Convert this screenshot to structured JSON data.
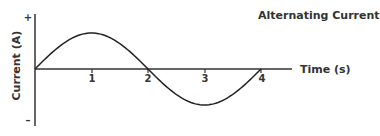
{
  "chart_data": {
    "type": "line",
    "title": "Alternating Current",
    "xlabel": "Time (s)",
    "ylabel": "Current (A)",
    "x_ticks": [
      "1",
      "2",
      "3",
      "4"
    ],
    "y_ticks": [
      "+",
      "–"
    ],
    "xlim": [
      0,
      4
    ],
    "ylim": [
      -1,
      1
    ],
    "grid": false,
    "legend": null,
    "series": [
      {
        "name": "current",
        "x": [
          0,
          0.5,
          1,
          1.5,
          2,
          2.5,
          3,
          3.5,
          4
        ],
        "y": [
          0,
          0.71,
          1,
          0.71,
          0,
          -0.71,
          -1,
          -0.71,
          0
        ]
      }
    ]
  }
}
